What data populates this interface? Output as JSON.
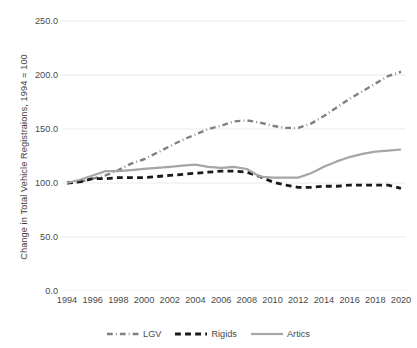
{
  "chart_data": {
    "type": "line",
    "title": "",
    "xlabel": "",
    "ylabel": "Change in Total Vehicle Registraions, 1994 = 100",
    "ylim": [
      0.0,
      250.0
    ],
    "xlim": [
      1994,
      2020
    ],
    "grid": true,
    "legend_position": "bottom",
    "ytick_labels": [
      "250.0",
      "200.0",
      "150.0",
      "100.0",
      "50.0",
      "0.0"
    ],
    "ytick_values": [
      250.0,
      200.0,
      150.0,
      100.0,
      50.0,
      0.0
    ],
    "xtick_labels": [
      "1994",
      "1996",
      "1998",
      "2000",
      "2002",
      "2004",
      "2006",
      "2008",
      "2010",
      "2012",
      "2014",
      "2016",
      "2018",
      "2020"
    ],
    "xtick_values": [
      1994,
      1996,
      1998,
      2000,
      2002,
      2004,
      2006,
      2008,
      2010,
      2012,
      2014,
      2016,
      2018,
      2020
    ],
    "x": [
      1994,
      1995,
      1996,
      1997,
      1998,
      1999,
      2000,
      2001,
      2002,
      2003,
      2004,
      2005,
      2006,
      2007,
      2008,
      2009,
      2010,
      2011,
      2012,
      2013,
      2014,
      2015,
      2016,
      2017,
      2018,
      2019,
      2020
    ],
    "series": [
      {
        "name": "LGV",
        "color": "#808080",
        "style": "dashdot",
        "width": 2.4,
        "values": [
          100,
          101,
          104,
          107,
          112,
          118,
          122,
          128,
          134,
          140,
          145,
          150,
          153,
          157,
          158,
          156,
          153,
          151,
          151,
          155,
          162,
          170,
          178,
          185,
          192,
          199,
          203
        ]
      },
      {
        "name": "Rigids",
        "color": "#1a1a1a",
        "style": "dashed",
        "width": 2.8,
        "values": [
          100,
          101,
          104,
          104,
          105,
          105,
          105,
          106,
          107,
          108,
          109,
          110,
          111,
          111,
          110,
          106,
          101,
          98,
          96,
          96,
          97,
          97,
          98,
          98,
          98,
          98,
          95
        ]
      },
      {
        "name": "Artics",
        "color": "#a6a6a6",
        "style": "solid",
        "width": 2.2,
        "values": [
          100,
          103,
          107,
          111,
          111,
          112,
          113,
          114,
          115,
          116,
          117,
          115,
          114,
          115,
          113,
          106,
          105,
          105,
          105,
          109,
          115,
          120,
          124,
          127,
          129,
          130,
          131
        ]
      }
    ]
  },
  "legend": {
    "items": [
      {
        "label": "LGV"
      },
      {
        "label": "Rigids"
      },
      {
        "label": "Artics"
      }
    ]
  },
  "colors": {
    "lgv": "#808080",
    "rigids": "#1a1a1a",
    "artics": "#a6a6a6",
    "grid": "#eaeaea",
    "text": "#4a4a4a",
    "background": "#ffffff"
  }
}
